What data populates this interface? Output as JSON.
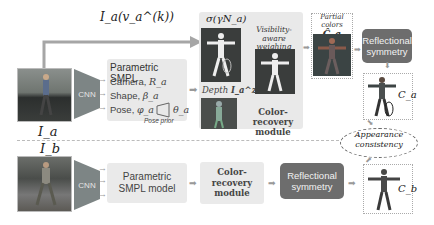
{
  "top_row": {
    "input_label": "I_a",
    "arrow_label": "I_a(v_a^(k))",
    "cnn_label": "CNN",
    "smpl_panel": {
      "title": "Parametric SMPL",
      "rows": [
        {
          "label": "Camera,",
          "symbol": "R_a"
        },
        {
          "label": "Shape,",
          "symbol": "β_a"
        },
        {
          "label": "Pose,",
          "symbol": "φ_a",
          "symbol2": "θ_a"
        }
      ],
      "pose_prior_label": "Pose prior"
    },
    "color_recovery_panel": {
      "sigma_label": "σ(γN_a)",
      "depth_label": "Depth",
      "depth_symbol": "I_a^z",
      "visibility_label_line1": "Visibility-aware",
      "visibility_label_line2": "weighing",
      "visibility_symbol": "W_a",
      "module_label_line1": "Color-recovery",
      "module_label_line2": "module"
    },
    "partial_colors": {
      "line1": "Partial",
      "line2": "colors",
      "symbol": "Ĉ_a"
    },
    "reflectional_symmetry_line1": "Reflectional",
    "reflectional_symmetry_line2": "symmetry",
    "output_symbol": "C_a"
  },
  "consistency": {
    "line1": "Appearance",
    "line2": "consistency"
  },
  "bottom_row": {
    "input_label": "I_b",
    "cnn_label": "CNN",
    "smpl_line1": "Parametric",
    "smpl_line2": "SMPL model",
    "color_recovery_line1": "Color-recovery",
    "color_recovery_line2": "module",
    "reflectional_symmetry_line1": "Reflectional",
    "reflectional_symmetry_line2": "symmetry",
    "output_symbol": "C_b"
  },
  "colors": {
    "dark_box": "#6d6d6d",
    "panel": "#e9e9e9",
    "cnn": "#7d8585",
    "arrow": "#999999"
  }
}
